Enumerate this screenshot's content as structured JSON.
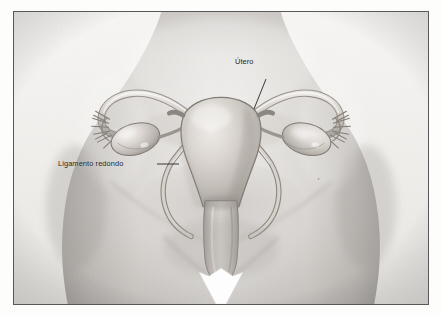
{
  "figure": {
    "kind": "anatomical-illustration",
    "language": "es",
    "frame": {
      "border_color": "#58585a",
      "background_color": "#f3f2f0",
      "margin_color": "#ffffff"
    },
    "palette": {
      "skin_light": "#f0eeec",
      "skin_mid": "#d8d5d1",
      "skin_shadow": "#b4b0ac",
      "skin_deep": "#9b9792",
      "organ_light": "#ded9d4",
      "organ_mid": "#c2bcb6",
      "organ_dark": "#8f8a85",
      "outline": "#6d6864",
      "leader_line": "#1a1a1a",
      "label_text": "#1a1a1a",
      "highlight": "#ffffff"
    }
  },
  "annotations": [
    {
      "id": "utero",
      "label": "Útero",
      "target": "uterus body (fundus)",
      "leader": {
        "from_x": 31,
        "from_y": 22,
        "to_x": 19,
        "to_y": 52
      }
    },
    {
      "id": "ligamento-redondo",
      "label": "Ligamento redondo",
      "target": "round ligament (left)",
      "leader": {
        "from_x": 99,
        "from_y": 5,
        "to_x": 121,
        "to_y": 5
      }
    }
  ],
  "structures": [
    {
      "name": "uterus",
      "label_shown": "Útero"
    },
    {
      "name": "round-ligament",
      "label_shown": "Ligamento redondo"
    },
    {
      "name": "fallopian-tube-left",
      "label_shown": ""
    },
    {
      "name": "fallopian-tube-right",
      "label_shown": ""
    },
    {
      "name": "ovary-left",
      "label_shown": ""
    },
    {
      "name": "ovary-right",
      "label_shown": ""
    },
    {
      "name": "fimbriae-left",
      "label_shown": ""
    },
    {
      "name": "fimbriae-right",
      "label_shown": ""
    },
    {
      "name": "vagina",
      "label_shown": ""
    },
    {
      "name": "torso-silhouette",
      "label_shown": ""
    }
  ]
}
